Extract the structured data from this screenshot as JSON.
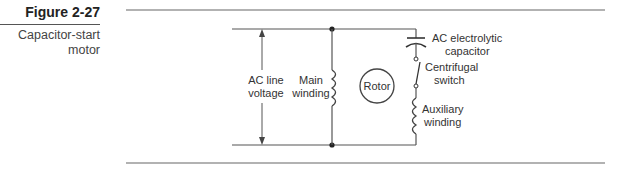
{
  "figure": {
    "number": "Figure 2-27",
    "caption_line1": "Capacitor-start",
    "caption_line2": "motor"
  },
  "diagram": {
    "labels": {
      "line_voltage_1": "AC line",
      "line_voltage_2": "voltage",
      "main_winding_1": "Main",
      "main_winding_2": "winding",
      "rotor": "Rotor",
      "capacitor_1": "AC electrolytic",
      "capacitor_2": "capacitor",
      "switch_1": "Centrifugal",
      "switch_2": "switch",
      "aux_winding_1": "Auxiliary",
      "aux_winding_2": "winding"
    },
    "colors": {
      "line": "#555555",
      "text": "#333333"
    }
  }
}
